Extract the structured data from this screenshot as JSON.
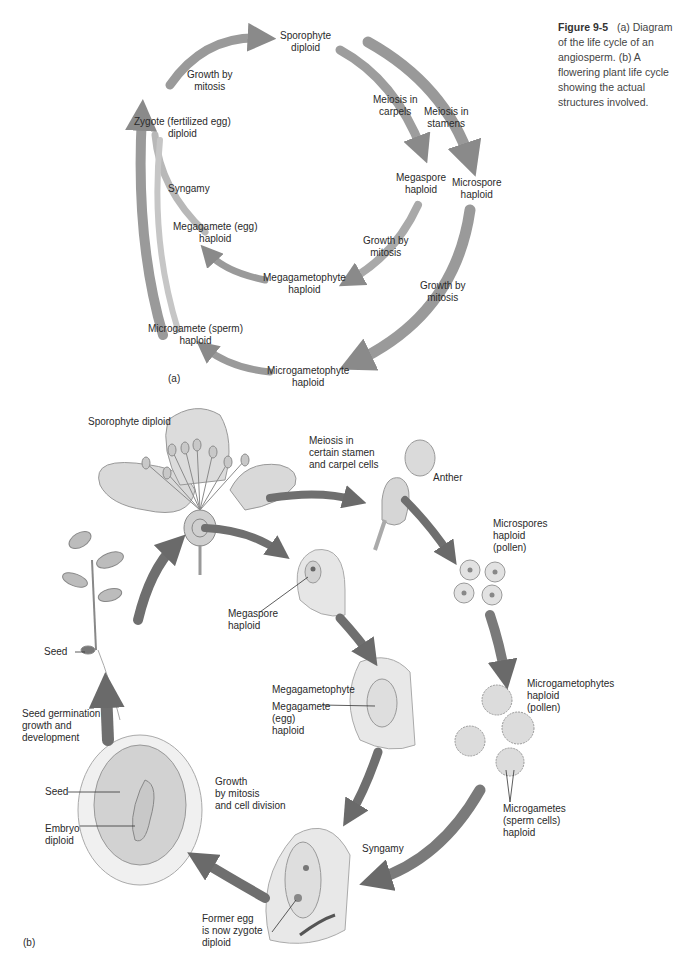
{
  "caption": {
    "figure_label": "Figure 9-5",
    "text": "(a) Diagram of the life cycle of an angiosperm. (b) A flowering plant life cycle showing the actual structures involved."
  },
  "panel_a": {
    "panel_label": "(a)",
    "nodes": {
      "sporophyte": [
        "Sporophyte",
        "diploid"
      ],
      "zygote": [
        "Zygote (fertilized egg)",
        "diploid"
      ],
      "megaspore": [
        "Megaspore",
        "haploid"
      ],
      "microspore": [
        "Microspore",
        "haploid"
      ],
      "megagamete": [
        "Megagamete (egg)",
        "haploid"
      ],
      "megagametophyte": [
        "Megagametophyte",
        "haploid"
      ],
      "microgamete": [
        "Microgamete (sperm)",
        "haploid"
      ],
      "microgametophyte": [
        "Microgametophyte",
        "haploid"
      ]
    },
    "processes": {
      "growth_top": [
        "Growth by",
        "mitosis"
      ],
      "meiosis_carpels": [
        "Meiosis in",
        "carpels"
      ],
      "meiosis_stamens": [
        "Meiosis in",
        "stamens"
      ],
      "syngamy": "Syngamy",
      "growth_mega": [
        "Growth by",
        "mitosis"
      ],
      "growth_micro": [
        "Growth by",
        "mitosis"
      ]
    }
  },
  "panel_b": {
    "panel_label": "(b)",
    "labels": {
      "sporophyte": "Sporophyte diploid",
      "meiosis": [
        "Meiosis in",
        "certain stamen",
        "and carpel cells"
      ],
      "anther": "Anther",
      "microspores": [
        "Microspores",
        "haploid",
        "(pollen)"
      ],
      "megaspore": [
        "Megaspore",
        "haploid"
      ],
      "seed_plant": "Seed",
      "seed_germination": [
        "Seed germination",
        "growth and",
        "development"
      ],
      "megagametophyte": "Megagametophyte",
      "megagamete": [
        "Megagamete",
        "(egg)",
        "haploid"
      ],
      "microgametophytes": [
        "Microgametophytes",
        "haploid",
        "(pollen)"
      ],
      "seed": "Seed",
      "embryo": [
        "Embryo",
        "diploid"
      ],
      "growth": [
        "Growth",
        "by mitosis",
        "and cell division"
      ],
      "microgametes": [
        "Microgametes",
        "(sperm cells)",
        "haploid"
      ],
      "syngamy": "Syngamy",
      "former_egg": [
        "Former egg",
        "is now zygote",
        "diploid"
      ]
    }
  }
}
